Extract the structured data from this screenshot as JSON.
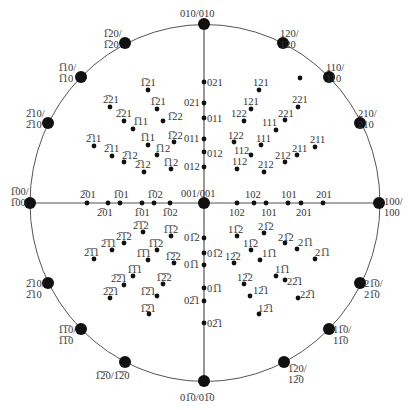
{
  "colors": {
    "line": "#555555",
    "dot": "#111111",
    "text": "#333333",
    "background": "#ffffff"
  },
  "circle": {
    "cx": 205,
    "cy": 203,
    "rx": 175,
    "ry": 178.5
  },
  "axes": {
    "horizontal": [
      30,
      379
    ],
    "vertical": [
      24,
      381
    ]
  },
  "edge_poles": [
    {
      "x": 204,
      "y": 24,
      "label": "010/010",
      "lx": 180,
      "ly": 8
    },
    {
      "x": 283,
      "y": 43,
      "label": "120/\n 120",
      "lx": 280,
      "ly": 28
    },
    {
      "x": 329,
      "y": 77,
      "label": "110/\n 110",
      "lx": 326,
      "ly": 62
    },
    {
      "x": 360,
      "y": 123,
      "label": "210/\n 210",
      "lx": 358,
      "ly": 108
    },
    {
      "x": 379,
      "y": 203,
      "label": "100/\n100",
      "lx": 384,
      "ly": 196
    },
    {
      "x": 125,
      "y": 43,
      "label": "1̅20/\n1̅20",
      "lx": 103,
      "ly": 28
    },
    {
      "x": 81,
      "y": 77,
      "label": "1̅10/\n1̅10",
      "lx": 58,
      "ly": 62
    },
    {
      "x": 48,
      "y": 123,
      "label": "2̅10/\n2̅10",
      "lx": 26,
      "ly": 108
    },
    {
      "x": 30,
      "y": 203,
      "label": "1̅00/\n1̅00",
      "lx": 10,
      "ly": 186
    },
    {
      "x": 48,
      "y": 283,
      "label": "2̅10/\n2̅10",
      "lx": 26,
      "ly": 278
    },
    {
      "x": 81,
      "y": 329,
      "label": "1̅1̅0/\n 1̅1̅0",
      "lx": 58,
      "ly": 324
    },
    {
      "x": 125,
      "y": 362,
      "label": "1̅2̅0/1̅2̅0",
      "lx": 95,
      "ly": 370
    },
    {
      "x": 204,
      "y": 381,
      "label": "01̅0/01̅0",
      "lx": 180,
      "ly": 392
    },
    {
      "x": 284,
      "y": 362,
      "label": "1̅20/\n12̅0",
      "lx": 288,
      "ly": 363
    },
    {
      "x": 329,
      "y": 329,
      "label": "11̅0/\n11̅0",
      "lx": 333,
      "ly": 324
    },
    {
      "x": 360,
      "y": 283,
      "label": "21̅0/\n21̅0",
      "lx": 364,
      "ly": 278
    }
  ],
  "poles": [
    {
      "x": 148,
      "y": 90,
      "label": "1̅21",
      "lx": 140,
      "ly": 77
    },
    {
      "x": 110,
      "y": 107,
      "label": "2̅21",
      "lx": 103,
      "ly": 94
    },
    {
      "x": 157,
      "y": 109,
      "label": "1̅21",
      "lx": 150,
      "ly": 96
    },
    {
      "x": 124,
      "y": 121,
      "label": "2̅21",
      "lx": 116,
      "ly": 108
    },
    {
      "x": 163,
      "y": 121,
      "label": "1̅22",
      "lx": 167,
      "ly": 111
    },
    {
      "x": 133,
      "y": 129,
      "label": "1̅11",
      "lx": 133,
      "ly": 116
    },
    {
      "x": 94,
      "y": 146,
      "label": "2̅11",
      "lx": 86,
      "ly": 133
    },
    {
      "x": 148,
      "y": 145,
      "label": "1̅11",
      "lx": 140,
      "ly": 132
    },
    {
      "x": 174,
      "y": 142,
      "label": "1̅22",
      "lx": 167,
      "ly": 130
    },
    {
      "x": 112,
      "y": 156,
      "label": "2̅11",
      "lx": 104,
      "ly": 143
    },
    {
      "x": 157,
      "y": 155,
      "label": "1̅12",
      "lx": 155,
      "ly": 143
    },
    {
      "x": 124,
      "y": 162,
      "label": "2̅12",
      "lx": 122,
      "ly": 150
    },
    {
      "x": 171,
      "y": 169,
      "label": "1̅12",
      "lx": 163,
      "ly": 157
    },
    {
      "x": 144,
      "y": 172,
      "label": "2̅12",
      "lx": 135,
      "ly": 159
    },
    {
      "x": 259,
      "y": 90,
      "label": "121",
      "lx": 253,
      "ly": 77
    },
    {
      "x": 251,
      "y": 109,
      "label": "121",
      "lx": 243,
      "ly": 96
    },
    {
      "x": 244,
      "y": 121,
      "label": "122",
      "lx": 231,
      "ly": 108
    },
    {
      "x": 298,
      "y": 107,
      "label": "221",
      "lx": 292,
      "ly": 94
    },
    {
      "x": 285,
      "y": 120,
      "label": "221",
      "lx": 278,
      "ly": 108
    },
    {
      "x": 276,
      "y": 130,
      "label": "111",
      "lx": 262,
      "ly": 117
    },
    {
      "x": 234,
      "y": 142,
      "label": "122",
      "lx": 228,
      "ly": 130
    },
    {
      "x": 261,
      "y": 145,
      "label": "111",
      "lx": 256,
      "ly": 133
    },
    {
      "x": 251,
      "y": 155,
      "label": "112",
      "lx": 234,
      "ly": 145
    },
    {
      "x": 315,
      "y": 147,
      "label": "211",
      "lx": 310,
      "ly": 134
    },
    {
      "x": 297,
      "y": 155,
      "label": "211",
      "lx": 292,
      "ly": 143
    },
    {
      "x": 285,
      "y": 162,
      "label": "212",
      "lx": 275,
      "ly": 150
    },
    {
      "x": 237,
      "y": 169,
      "label": "112",
      "lx": 232,
      "ly": 156
    },
    {
      "x": 264,
      "y": 172,
      "label": "212",
      "lx": 258,
      "ly": 159
    },
    {
      "x": 300,
      "y": 78,
      "label": "",
      "lx": 0,
      "ly": 0
    },
    {
      "x": 204,
      "y": 82,
      "label": "021",
      "lx": 207,
      "ly": 77
    },
    {
      "x": 204,
      "y": 103,
      "label": "021",
      "lx": 184,
      "ly": 97
    },
    {
      "x": 204,
      "y": 118,
      "label": "011",
      "lx": 207,
      "ly": 113
    },
    {
      "x": 204,
      "y": 139,
      "label": "011",
      "lx": 184,
      "ly": 133
    },
    {
      "x": 204,
      "y": 152,
      "label": "012",
      "lx": 207,
      "ly": 148
    },
    {
      "x": 204,
      "y": 167,
      "label": "012",
      "lx": 184,
      "ly": 161
    },
    {
      "x": 87,
      "y": 203,
      "label": "2̅01",
      "lx": 80,
      "ly": 189
    },
    {
      "x": 108,
      "y": 203,
      "label": "2̅01",
      "lx": 97,
      "ly": 207
    },
    {
      "x": 120,
      "y": 203,
      "label": "1̅01",
      "lx": 113,
      "ly": 189
    },
    {
      "x": 142,
      "y": 203,
      "label": "1̅01",
      "lx": 134,
      "ly": 207
    },
    {
      "x": 154,
      "y": 203,
      "label": "1̅02",
      "lx": 147,
      "ly": 189
    },
    {
      "x": 170,
      "y": 203,
      "label": "1̅02",
      "lx": 162,
      "ly": 207
    },
    {
      "x": 237,
      "y": 203,
      "label": "102",
      "lx": 229,
      "ly": 207
    },
    {
      "x": 254,
      "y": 203,
      "label": "102",
      "lx": 245,
      "ly": 189
    },
    {
      "x": 266,
      "y": 203,
      "label": "101",
      "lx": 261,
      "ly": 207
    },
    {
      "x": 288,
      "y": 203,
      "label": "101",
      "lx": 281,
      "ly": 189
    },
    {
      "x": 301,
      "y": 203,
      "label": "201",
      "lx": 296,
      "ly": 207
    },
    {
      "x": 323,
      "y": 203,
      "label": "201",
      "lx": 316,
      "ly": 189
    },
    {
      "x": 204,
      "y": 238,
      "label": "01̅2",
      "lx": 184,
      "ly": 232
    },
    {
      "x": 204,
      "y": 253,
      "label": "01̅2",
      "lx": 207,
      "ly": 248
    },
    {
      "x": 204,
      "y": 265,
      "label": "01̅1",
      "lx": 184,
      "ly": 259
    },
    {
      "x": 204,
      "y": 288,
      "label": "01̅1",
      "lx": 207,
      "ly": 283
    },
    {
      "x": 204,
      "y": 301,
      "label": "02̅1",
      "lx": 184,
      "ly": 295
    },
    {
      "x": 204,
      "y": 323,
      "label": "02̅1",
      "lx": 207,
      "ly": 318
    },
    {
      "x": 143,
      "y": 232,
      "label": "2̅1̅2",
      "lx": 133,
      "ly": 220
    },
    {
      "x": 171,
      "y": 236,
      "label": "1̅1̅2",
      "lx": 163,
      "ly": 224
    },
    {
      "x": 124,
      "y": 243,
      "label": "2̅1̅2",
      "lx": 116,
      "ly": 231
    },
    {
      "x": 157,
      "y": 250,
      "label": "1̅1̅2",
      "lx": 148,
      "ly": 238
    },
    {
      "x": 112,
      "y": 250,
      "label": "2̅1̅1",
      "lx": 101,
      "ly": 238
    },
    {
      "x": 94,
      "y": 259,
      "label": "2̅1̅1",
      "lx": 84,
      "ly": 247
    },
    {
      "x": 148,
      "y": 260,
      "label": "1̅1̅1",
      "lx": 136,
      "ly": 248
    },
    {
      "x": 174,
      "y": 263,
      "label": "1̅2̅2",
      "lx": 165,
      "ly": 251
    },
    {
      "x": 133,
      "y": 276,
      "label": "1̅1̅1",
      "lx": 127,
      "ly": 264
    },
    {
      "x": 124,
      "y": 285,
      "label": "2̅2̅1",
      "lx": 111,
      "ly": 273
    },
    {
      "x": 163,
      "y": 284,
      "label": "1̅2̅2",
      "lx": 156,
      "ly": 272
    },
    {
      "x": 110,
      "y": 298,
      "label": "2̅2̅1",
      "lx": 103,
      "ly": 286
    },
    {
      "x": 157,
      "y": 296,
      "label": "1̅2̅1",
      "lx": 140,
      "ly": 286
    },
    {
      "x": 149,
      "y": 314,
      "label": "1̅2̅1",
      "lx": 140,
      "ly": 303
    },
    {
      "x": 237,
      "y": 236,
      "label": "11̅2",
      "lx": 228,
      "ly": 224
    },
    {
      "x": 264,
      "y": 233,
      "label": "21̅2",
      "lx": 258,
      "ly": 221
    },
    {
      "x": 251,
      "y": 250,
      "label": "11̅2",
      "lx": 243,
      "ly": 238
    },
    {
      "x": 285,
      "y": 243,
      "label": "21̅2",
      "lx": 278,
      "ly": 232
    },
    {
      "x": 297,
      "y": 249,
      "label": "21̅1",
      "lx": 298,
      "ly": 237
    },
    {
      "x": 315,
      "y": 259,
      "label": "21̅1",
      "lx": 315,
      "ly": 247
    },
    {
      "x": 260,
      "y": 260,
      "label": "11̅1",
      "lx": 262,
      "ly": 248
    },
    {
      "x": 234,
      "y": 263,
      "label": "12̅2",
      "lx": 225,
      "ly": 251
    },
    {
      "x": 276,
      "y": 276,
      "label": "11̅1",
      "lx": 275,
      "ly": 264
    },
    {
      "x": 285,
      "y": 280,
      "label": "22̅1",
      "lx": 287,
      "ly": 276
    },
    {
      "x": 244,
      "y": 284,
      "label": "12̅2",
      "lx": 237,
      "ly": 272
    },
    {
      "x": 250,
      "y": 296,
      "label": "12̅1",
      "lx": 253,
      "ly": 285
    },
    {
      "x": 298,
      "y": 298,
      "label": "22̅1",
      "lx": 300,
      "ly": 289
    },
    {
      "x": 259,
      "y": 314,
      "label": "12̅1",
      "lx": 258,
      "ly": 303
    }
  ]
}
